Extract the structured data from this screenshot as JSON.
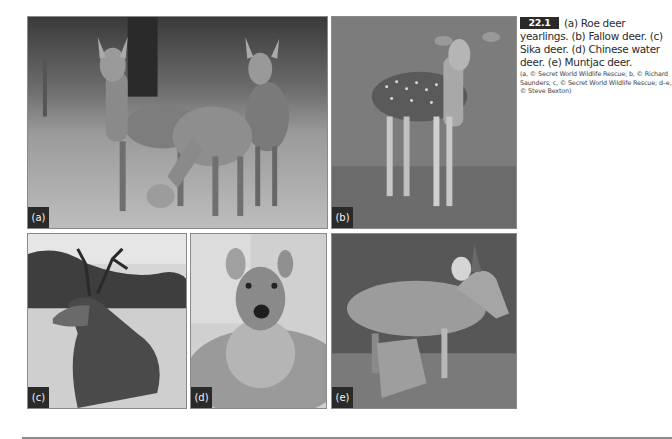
{
  "figure": {
    "number": "22.1",
    "caption": "(a) Roe deer yearlings. (b) Fallow deer. (c) Sika deer. (d) Chinese water deer. (e) Muntjac deer.",
    "credits": "(a, © Secret World Wildlife Rescue; b, © Richard Saunders; c, © Secret World Wildlife Rescue; d–e, © Steve Bexton)",
    "color_mode": "grayscale",
    "panels": [
      {
        "id": "a",
        "label": "(a)",
        "subject": "Roe deer yearlings"
      },
      {
        "id": "b",
        "label": "(b)",
        "subject": "Fallow deer"
      },
      {
        "id": "c",
        "label": "(c)",
        "subject": "Sika deer"
      },
      {
        "id": "d",
        "label": "(d)",
        "subject": "Chinese water deer"
      },
      {
        "id": "e",
        "label": "(e)",
        "subject": "Muntjac deer"
      }
    ]
  }
}
